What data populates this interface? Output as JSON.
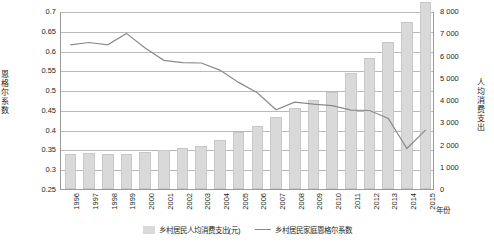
{
  "chart_data": {
    "type": "bar",
    "title": "",
    "xlabel": "年份",
    "ylabel_left": "恩格尔系数",
    "ylabel_right": "人均消费支出",
    "categories": [
      "1996",
      "1997",
      "1998",
      "1999",
      "2000",
      "2001",
      "2002",
      "2003",
      "2004",
      "2005",
      "2006",
      "2007",
      "2008",
      "2009",
      "2010",
      "2011",
      "2012",
      "2013",
      "2014",
      "2015"
    ],
    "left_axis": {
      "min": 0.25,
      "max": 0.7,
      "ticks": [
        "0.7",
        "0.65",
        "0.6",
        "0.55",
        "0.5",
        "0.45",
        "0.4",
        "0.35",
        "0.3",
        "0.25"
      ]
    },
    "right_axis": {
      "min": 0,
      "max": 8000,
      "ticks": [
        "8 000",
        "7 000",
        "6 000",
        "5 000",
        "4 000",
        "3 000",
        "2 000",
        "1 000",
        "0"
      ]
    },
    "series": [
      {
        "name": "乡村居民人均消费支出(元)",
        "type": "bar",
        "axis": "right",
        "values": [
          1572,
          1617,
          1590,
          1577,
          1670,
          1741,
          1834,
          1943,
          2185,
          2555,
          2829,
          3224,
          3661,
          3994,
          4382,
          5222,
          5908,
          6626,
          7485,
          8383
        ]
      },
      {
        "name": "乡村居民家庭恩格尔系数",
        "type": "line",
        "axis": "left",
        "values": [
          0.617,
          0.623,
          0.617,
          0.646,
          0.609,
          0.578,
          0.572,
          0.571,
          0.553,
          0.522,
          0.496,
          0.453,
          0.472,
          0.467,
          0.463,
          0.452,
          0.451,
          0.431,
          0.355,
          0.402
        ]
      }
    ],
    "legend": [
      {
        "label": "乡村居民人均消费支出(元)",
        "marker": "bar",
        "color": "#d9d9d9"
      },
      {
        "label": "乡村居民家庭恩格尔系数",
        "marker": "line",
        "color": "#8a8a8a"
      }
    ],
    "grid": true,
    "legend_position": "bottom"
  }
}
